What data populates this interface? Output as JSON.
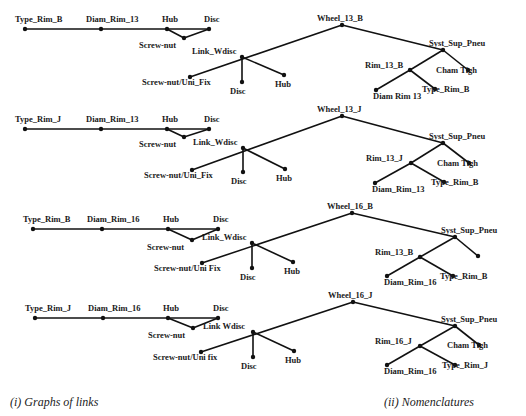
{
  "graphs_of_links": [
    {
      "row": 1,
      "chain": [
        "Type_Rim_B",
        "Diam_Rim_13",
        "Hub",
        "Disc"
      ],
      "screw_nut": "Screw-nut",
      "link": "Link_Wdisc",
      "link_children": [
        "Screw-nut/Uni_Fix",
        "Disc",
        "Hub"
      ]
    },
    {
      "row": 2,
      "chain": [
        "Type_Rim_J",
        "Diam_Rim_13",
        "Hub",
        "Disc"
      ],
      "screw_nut": "Screw-nut",
      "link": "Link_Wdisc",
      "link_children": [
        "Screw-nut/Uni_Fix",
        "Disc",
        "Hub"
      ]
    },
    {
      "row": 3,
      "chain": [
        "Type_Rim_B",
        "Diam_Rim_16",
        "Hub",
        "Disc"
      ],
      "screw_nut": "Screw-nut",
      "link": "Link_Wdisc",
      "link_children": [
        "Screw-nut/Uni Fix",
        "Disc",
        "Hub"
      ]
    },
    {
      "row": 4,
      "chain": [
        "Type_Rim_J",
        "Diam_Rim_16",
        "Hub",
        "Disc"
      ],
      "screw_nut": "Screw-nut",
      "link": "Link Wdisc",
      "link_children": [
        "Screw-nut/Uni fix",
        "Disc",
        "Hub"
      ]
    }
  ],
  "nomenclatures": [
    {
      "root": "Wheel_13_B",
      "syst": "Syst_Sup_Pneu",
      "rim": "Rim_13_B",
      "rim_children": [
        "Diam Rim 13",
        "Type_Rim_B"
      ],
      "cham": "Cham Tigh"
    },
    {
      "root": "Wheel_13_J",
      "syst": "Syst_Sup_Pneu",
      "rim": "Rim_13_J",
      "rim_children": [
        "Diam_Rim_13",
        "Type_Rim_B"
      ],
      "cham": "Cham Tigh"
    },
    {
      "root": "Wheel_16_B",
      "syst": "Syst_Sup_Pneu",
      "rim": "Rim_13_B",
      "rim_children": [
        "Diam_Rim_16",
        "Type_Rim_B"
      ],
      "cham": ""
    },
    {
      "root": "Wheel_16_J",
      "syst": "Syst_Sup_Pneu",
      "rim": "Rim_16_J",
      "rim_children": [
        "Diam_Rim_16",
        "Type_Rim_J"
      ],
      "cham": "Cham Tigh"
    }
  ],
  "captions": {
    "left": "(i) Graphs of links",
    "right": "(ii) Nomenclatures"
  }
}
